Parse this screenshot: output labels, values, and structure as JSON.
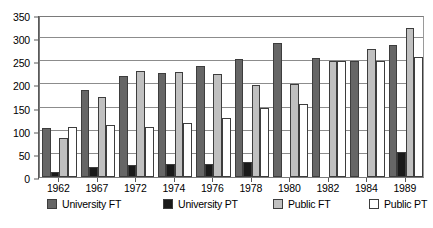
{
  "chart_data": {
    "type": "bar",
    "title": "",
    "subtitle": "",
    "xlabel": "",
    "ylabel": "",
    "categories": [
      "1962",
      "1967",
      "1972",
      "1974",
      "1976",
      "1978",
      "1980",
      "1982",
      "1984",
      "1989"
    ],
    "series": [
      {
        "name": "University FT",
        "color": "#666666",
        "values": [
          105,
          187,
          219,
          224,
          240,
          255,
          290,
          257,
          250,
          285
        ]
      },
      {
        "name": "University PT",
        "color": "#1a1a1a",
        "values": [
          10,
          22,
          25,
          28,
          28,
          32,
          0,
          0,
          0,
          53
        ]
      },
      {
        "name": "Public FT",
        "color": "#c0c0c0",
        "values": [
          85,
          173,
          228,
          226,
          222,
          198,
          200,
          250,
          276,
          322
        ]
      },
      {
        "name": "Public PT",
        "color": "#ffffff",
        "values": [
          108,
          113,
          108,
          117,
          128,
          150,
          158,
          250,
          250,
          260
        ]
      }
    ],
    "ylim": [
      0,
      350
    ],
    "ytick_values": [
      0,
      50,
      100,
      150,
      200,
      250,
      300,
      350
    ],
    "ytick_labels": [
      "0",
      "50",
      "100",
      "150",
      "200",
      "250",
      "300",
      "350"
    ],
    "grid": true,
    "grid_axis": "y",
    "legend_position": "bottom",
    "bar_outline_color": "#3d3d3d",
    "plot_border_color": "#7a7a7a",
    "gridline_color": "#8c8c8c",
    "background_color": "#ffffff"
  }
}
